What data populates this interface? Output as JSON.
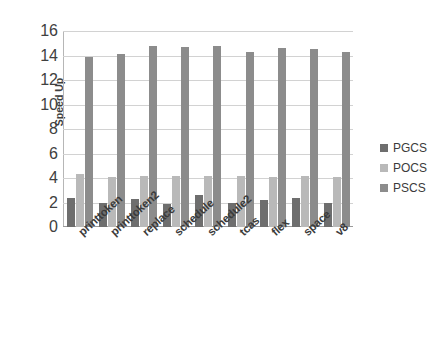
{
  "chart_data": {
    "type": "bar",
    "title": "",
    "xlabel": "",
    "ylabel": "Speed Up",
    "ylim": [
      0,
      16
    ],
    "ytick_step": 2,
    "yticks": [
      16,
      14,
      12,
      10,
      8,
      6,
      4,
      2,
      0
    ],
    "grid": true,
    "legend_position": "right",
    "categories": [
      "printtoken",
      "printtoken2",
      "replace",
      "schedule",
      "schedule2",
      "tcas",
      "flex",
      "space",
      "v8"
    ],
    "series": [
      {
        "name": "PGCS",
        "color": "#6e6e6e",
        "values": [
          2.4,
          2.0,
          2.3,
          1.9,
          2.6,
          2.0,
          2.2,
          2.4,
          2.0
        ]
      },
      {
        "name": "POCS",
        "color": "#b9b9b9",
        "values": [
          4.3,
          4.1,
          4.2,
          4.2,
          4.2,
          4.2,
          4.1,
          4.2,
          4.1
        ]
      },
      {
        "name": "PSCS",
        "color": "#8c8c8c",
        "values": [
          13.9,
          14.1,
          14.8,
          14.7,
          14.8,
          14.3,
          14.6,
          14.5,
          14.3
        ]
      }
    ]
  },
  "legend": {
    "items": [
      {
        "label": "PGCS",
        "color": "#6e6e6e"
      },
      {
        "label": "POCS",
        "color": "#b9b9b9"
      },
      {
        "label": "PSCS",
        "color": "#8c8c8c"
      }
    ]
  }
}
